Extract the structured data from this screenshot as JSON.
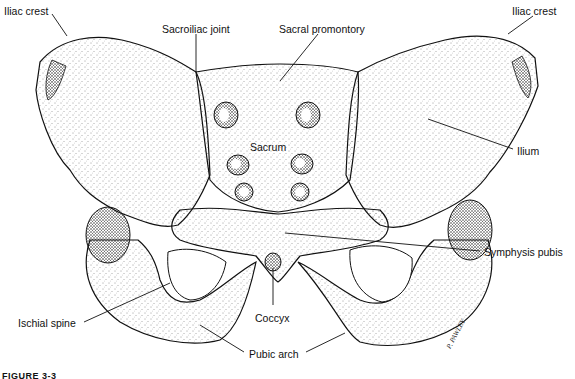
{
  "figure": {
    "caption": "FIGURE 3-3",
    "signature": "P. PAWLEY"
  },
  "labels": [
    {
      "id": "iliac-crest-left",
      "text": "Iliac crest",
      "x": 4,
      "y": 6
    },
    {
      "id": "sacroiliac-joint",
      "text": "Sacroiliac joint",
      "x": 162,
      "y": 24
    },
    {
      "id": "sacral-promontory",
      "text": "Sacral promontory",
      "x": 279,
      "y": 24
    },
    {
      "id": "iliac-crest-right",
      "text": "Iliac crest",
      "x": 512,
      "y": 6
    },
    {
      "id": "sacrum",
      "text": "Sacrum",
      "x": 250,
      "y": 142
    },
    {
      "id": "ilium",
      "text": "Ilium",
      "x": 517,
      "y": 146
    },
    {
      "id": "symphysis-pubis",
      "text": "Symphysis pubis",
      "x": 484,
      "y": 247
    },
    {
      "id": "ischial-spine",
      "text": "Ischial spine",
      "x": 18,
      "y": 318
    },
    {
      "id": "coccyx",
      "text": "Coccyx",
      "x": 255,
      "y": 313
    },
    {
      "id": "pubic-arch",
      "text": "Pubic arch",
      "x": 249,
      "y": 349
    }
  ],
  "leader_lines": [
    {
      "label": "iliac-crest-left",
      "x1": 52,
      "y1": 14,
      "x2": 67,
      "y2": 36
    },
    {
      "label": "sacroiliac-joint",
      "x1": 196,
      "y1": 34,
      "x2": 196,
      "y2": 72
    },
    {
      "label": "sacral-promontory",
      "x1": 318,
      "y1": 34,
      "x2": 280,
      "y2": 81
    },
    {
      "label": "iliac-crest-right",
      "x1": 533,
      "y1": 16,
      "x2": 508,
      "y2": 34
    },
    {
      "label": "ilium",
      "x1": 513,
      "y1": 149,
      "x2": 428,
      "y2": 119
    },
    {
      "label": "symphysis-pubis",
      "x1": 480,
      "y1": 251,
      "x2": 285,
      "y2": 233
    },
    {
      "label": "ischial-spine",
      "x1": 84,
      "y1": 322,
      "x2": 170,
      "y2": 283
    },
    {
      "label": "coccyx",
      "x1": 273,
      "y1": 305,
      "x2": 273,
      "y2": 268
    },
    {
      "label": "pubic-arch-left",
      "x1": 244,
      "y1": 352,
      "x2": 200,
      "y2": 325
    },
    {
      "label": "pubic-arch-right",
      "x1": 306,
      "y1": 352,
      "x2": 345,
      "y2": 333
    }
  ],
  "colors": {
    "ink": "#111111",
    "background": "#ffffff",
    "stipple": "#333333"
  }
}
